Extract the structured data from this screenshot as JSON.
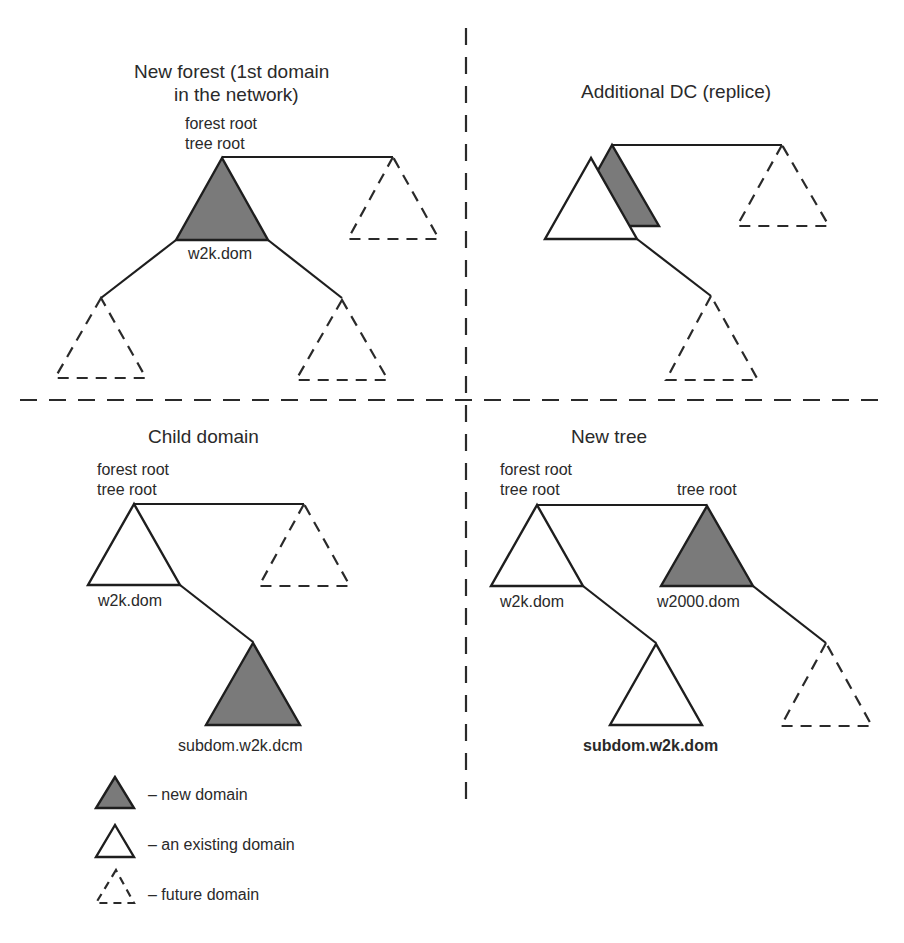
{
  "colors": {
    "new_domain_fill": "#7a7a7a",
    "line": "#1e1e1e",
    "background": "#ffffff"
  },
  "panels": {
    "new_forest": {
      "title_line1": "New forest (1st domain",
      "title_line2": "in the network)",
      "root_label_line1": "forest root",
      "root_label_line2": "tree root",
      "domain_label": "w2k.dom"
    },
    "additional_dc": {
      "title": "Additional DC (replice)"
    },
    "child_domain": {
      "title": "Child domain",
      "root_label_line1": "forest root",
      "root_label_line2": "tree root",
      "parent_label": "w2k.dom",
      "child_label": "subdom.w2k.dcm"
    },
    "new_tree": {
      "title": "New tree",
      "root_label_line1": "forest root",
      "root_label_line2": "tree root",
      "second_root_label": "tree root",
      "first_domain_label": "w2k.dom",
      "second_domain_label": "w2000.dom",
      "child_label": "subdom.w2k.dom"
    }
  },
  "legend": [
    {
      "icon": "filled-triangle-icon",
      "label": "– new domain"
    },
    {
      "icon": "outline-triangle-icon",
      "label": "– an existing domain"
    },
    {
      "icon": "dashed-triangle-icon",
      "label": "– future domain"
    }
  ]
}
